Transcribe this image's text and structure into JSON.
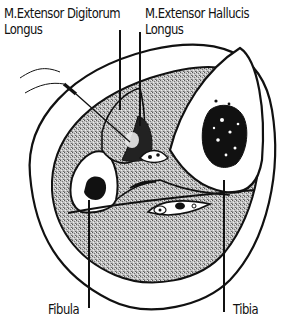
{
  "diagram": {
    "type": "anatomical-cross-section",
    "colors": {
      "line": "#111111",
      "muscle_fill": "#b8b8b8",
      "bone_fill": "#ffffff",
      "background": "#ffffff"
    },
    "labels": {
      "edl_line1": "M.Extensor Digitorum",
      "edl_line2": "Longus",
      "ehl_line1": "M.Extensor Hallucis",
      "ehl_line2": "Longus",
      "fibula": "Fibula",
      "tibia": "Tibia"
    },
    "structures": [
      "outer skin contour",
      "muscle compartment",
      "tibia bone with marrow",
      "fibula bone with marrow",
      "extensor digitorum longus muscle",
      "extensor hallucis longus muscle",
      "neurovascular bundle",
      "interosseous membrane",
      "needle electrode"
    ]
  }
}
